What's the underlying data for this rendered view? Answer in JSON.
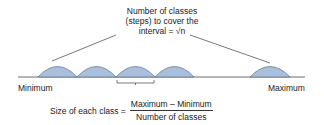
{
  "top_label": {
    "line1": "Number of classes",
    "line2": "(steps) to cover the",
    "line3": "interval = √n"
  },
  "axis": {
    "min_label": "Minimum",
    "max_label": "Maximum"
  },
  "formula": {
    "lhs": "Size of each class =",
    "numerator": "Maximum – Minimum",
    "denominator": "Number of classes"
  },
  "colors": {
    "arc_fill": "#a9bfdc",
    "arc_stroke": "#5a6f8c",
    "line": "#555555"
  }
}
